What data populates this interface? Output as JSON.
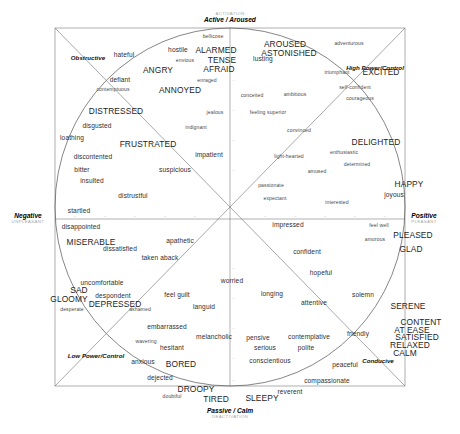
{
  "figure": {
    "type": "scatter",
    "frame": {
      "x": 55,
      "y": 28,
      "w": 350,
      "h": 358
    }
  },
  "axes": {
    "top": {
      "label": "Active / Aroused",
      "sub": "ACTIVATION",
      "x": 230,
      "y": 18
    },
    "bottom": {
      "label": "Passive / Calm",
      "sub": "DEACTIVATION",
      "x": 230,
      "y": 417
    },
    "left": {
      "label": "Negative",
      "sub": "UNPLEASANT",
      "x": 28,
      "y": 219
    },
    "right": {
      "label": "Positive",
      "sub": "PLEASANT",
      "x": 424,
      "y": 219
    }
  },
  "diagonals": [
    {
      "name": "obstructive",
      "label": "Obstructive",
      "x": 88,
      "y": 57
    },
    {
      "name": "high-power",
      "label": "High Power/Control",
      "x": 375,
      "y": 67
    },
    {
      "name": "low-power",
      "label": "Low Power/Control",
      "x": 96,
      "y": 355
    },
    {
      "name": "conducive",
      "label": "Conducive",
      "x": 378,
      "y": 360
    }
  ],
  "ticks": {
    "horizontal": [
      75,
      105,
      135,
      165,
      195,
      265,
      295,
      325,
      355,
      385
    ],
    "vertical": [
      50,
      80,
      110,
      140,
      170,
      268,
      298,
      328,
      358,
      380
    ],
    "axis_y": 219,
    "axis_x": 230
  },
  "chart_data": {
    "type": "scatter",
    "xlabel": "Valence (Unpleasant – Pleasant)",
    "ylabel": "Arousal (Deactivation – Activation)",
    "xlim": [
      -1,
      1
    ],
    "ylim": [
      -1,
      1
    ],
    "grid": false,
    "legend": "none",
    "terms": [
      {
        "label": "bellicose",
        "x": 213,
        "y": 37,
        "size": "sm"
      },
      {
        "label": "hostile",
        "x": 178,
        "y": 50,
        "size": "md"
      },
      {
        "label": "ALARMED",
        "x": 216,
        "y": 50,
        "size": "lg"
      },
      {
        "label": "AROUSED",
        "x": 285,
        "y": 44,
        "size": "lg"
      },
      {
        "label": "adventurous",
        "x": 349,
        "y": 44,
        "size": "sm"
      },
      {
        "label": "hateful",
        "x": 124,
        "y": 55,
        "size": "md"
      },
      {
        "label": "ASTONISHED",
        "x": 289,
        "y": 53,
        "size": "lg"
      },
      {
        "label": "TENSE",
        "x": 222,
        "y": 60,
        "size": "lg"
      },
      {
        "label": "envious",
        "x": 185,
        "y": 61,
        "size": "sm"
      },
      {
        "label": "EXCITED",
        "x": 381,
        "y": 72,
        "size": "lg"
      },
      {
        "label": "lusting",
        "x": 263,
        "y": 59,
        "size": "md"
      },
      {
        "label": "ANGRY",
        "x": 158,
        "y": 70,
        "size": "lg"
      },
      {
        "label": "AFRAID",
        "x": 219,
        "y": 69,
        "size": "lg"
      },
      {
        "label": "triumphant",
        "x": 337,
        "y": 73,
        "size": "sm"
      },
      {
        "label": "defiant",
        "x": 120,
        "y": 80,
        "size": "md"
      },
      {
        "label": "enraged",
        "x": 207,
        "y": 81,
        "size": "sm"
      },
      {
        "label": "self-confident",
        "x": 355,
        "y": 88,
        "size": "sm"
      },
      {
        "label": "contemptuous",
        "x": 113,
        "y": 90,
        "size": "sm"
      },
      {
        "label": "ANNOYED",
        "x": 180,
        "y": 90,
        "size": "lg"
      },
      {
        "label": "conceited",
        "x": 252,
        "y": 96,
        "size": "sm"
      },
      {
        "label": "ambitious",
        "x": 295,
        "y": 95,
        "size": "sm"
      },
      {
        "label": "courageous",
        "x": 360,
        "y": 99,
        "size": "sm"
      },
      {
        "label": "DISTRESSED",
        "x": 116,
        "y": 111,
        "size": "lg"
      },
      {
        "label": "jealous",
        "x": 215,
        "y": 113,
        "size": "sm"
      },
      {
        "label": "feeling superior",
        "x": 268,
        "y": 113,
        "size": "sm"
      },
      {
        "label": "disgusted",
        "x": 97,
        "y": 126,
        "size": "md"
      },
      {
        "label": "indignant",
        "x": 196,
        "y": 128,
        "size": "sm"
      },
      {
        "label": "convinced",
        "x": 299,
        "y": 131,
        "size": "sm"
      },
      {
        "label": "DELIGHTED",
        "x": 376,
        "y": 142,
        "size": "lg"
      },
      {
        "label": "loathing",
        "x": 72,
        "y": 138,
        "size": "md"
      },
      {
        "label": "FRUSTRATED",
        "x": 148,
        "y": 144,
        "size": "lg"
      },
      {
        "label": "light-hearted",
        "x": 289,
        "y": 157,
        "size": "sm"
      },
      {
        "label": "enthusiastic",
        "x": 344,
        "y": 153,
        "size": "sm"
      },
      {
        "label": "discontented",
        "x": 93,
        "y": 157,
        "size": "md"
      },
      {
        "label": "impatient",
        "x": 209,
        "y": 155,
        "size": "md"
      },
      {
        "label": "determined",
        "x": 357,
        "y": 165,
        "size": "sm"
      },
      {
        "label": "bitter",
        "x": 82,
        "y": 170,
        "size": "md"
      },
      {
        "label": "suspicious",
        "x": 175,
        "y": 170,
        "size": "md"
      },
      {
        "label": "amused",
        "x": 317,
        "y": 172,
        "size": "sm"
      },
      {
        "label": "insulted",
        "x": 92,
        "y": 181,
        "size": "md"
      },
      {
        "label": "HAPPY",
        "x": 409,
        "y": 184,
        "size": "lg"
      },
      {
        "label": "passionate",
        "x": 271,
        "y": 186,
        "size": "sm"
      },
      {
        "label": "joyous",
        "x": 394,
        "y": 195,
        "size": "md"
      },
      {
        "label": "distrustful",
        "x": 133,
        "y": 196,
        "size": "md"
      },
      {
        "label": "expectant",
        "x": 275,
        "y": 199,
        "size": "sm"
      },
      {
        "label": "interested",
        "x": 337,
        "y": 203,
        "size": "sm"
      },
      {
        "label": "startled",
        "x": 79,
        "y": 211,
        "size": "md"
      },
      {
        "label": "disappointed",
        "x": 81,
        "y": 227,
        "size": "md"
      },
      {
        "label": "impressed",
        "x": 288,
        "y": 225,
        "size": "md"
      },
      {
        "label": "feel well",
        "x": 379,
        "y": 226,
        "size": "sm"
      },
      {
        "label": "MISERABLE",
        "x": 91,
        "y": 242,
        "size": "lg"
      },
      {
        "label": "apathetic",
        "x": 180,
        "y": 241,
        "size": "md"
      },
      {
        "label": "PLEASED",
        "x": 413,
        "y": 235,
        "size": "lg"
      },
      {
        "label": "dissatisfied",
        "x": 120,
        "y": 249,
        "size": "md"
      },
      {
        "label": "amorous",
        "x": 375,
        "y": 240,
        "size": "sm"
      },
      {
        "label": "GLAD",
        "x": 411,
        "y": 249,
        "size": "lg"
      },
      {
        "label": "taken aback",
        "x": 160,
        "y": 258,
        "size": "md"
      },
      {
        "label": "confident",
        "x": 307,
        "y": 252,
        "size": "md"
      },
      {
        "label": "worried",
        "x": 232,
        "y": 281,
        "size": "md"
      },
      {
        "label": "uncomfortable",
        "x": 102,
        "y": 283,
        "size": "md"
      },
      {
        "label": "hopeful",
        "x": 321,
        "y": 273,
        "size": "md"
      },
      {
        "label": "SAD",
        "x": 79,
        "y": 290,
        "size": "lg"
      },
      {
        "label": "feel guilt",
        "x": 177,
        "y": 295,
        "size": "md"
      },
      {
        "label": "longing",
        "x": 272,
        "y": 294,
        "size": "md"
      },
      {
        "label": "despondent",
        "x": 113,
        "y": 296,
        "size": "md"
      },
      {
        "label": "attentive",
        "x": 314,
        "y": 303,
        "size": "md"
      },
      {
        "label": "solemn",
        "x": 363,
        "y": 295,
        "size": "md"
      },
      {
        "label": "SERENE",
        "x": 408,
        "y": 306,
        "size": "lg"
      },
      {
        "label": "GLOOMY",
        "x": 69,
        "y": 299,
        "size": "lg"
      },
      {
        "label": "DEPRESSED",
        "x": 115,
        "y": 304,
        "size": "lg"
      },
      {
        "label": "languid",
        "x": 204,
        "y": 307,
        "size": "md"
      },
      {
        "label": "desperate",
        "x": 72,
        "y": 310,
        "size": "sm"
      },
      {
        "label": "ashamed",
        "x": 140,
        "y": 310,
        "size": "sm"
      },
      {
        "label": "CONTENT",
        "x": 421,
        "y": 322,
        "size": "lg"
      },
      {
        "label": "embarrassed",
        "x": 167,
        "y": 327,
        "size": "md"
      },
      {
        "label": "AT EASE",
        "x": 412,
        "y": 330,
        "size": "lg"
      },
      {
        "label": "pensive",
        "x": 258,
        "y": 338,
        "size": "md"
      },
      {
        "label": "contemplative",
        "x": 309,
        "y": 337,
        "size": "md"
      },
      {
        "label": "friendly",
        "x": 358,
        "y": 334,
        "size": "md"
      },
      {
        "label": "SATISFIED",
        "x": 417,
        "y": 337,
        "size": "lg"
      },
      {
        "label": "melancholic",
        "x": 214,
        "y": 337,
        "size": "md"
      },
      {
        "label": "RELAXED",
        "x": 410,
        "y": 345,
        "size": "lg"
      },
      {
        "label": "hesitant",
        "x": 172,
        "y": 348,
        "size": "md"
      },
      {
        "label": "serious",
        "x": 265,
        "y": 348,
        "size": "md"
      },
      {
        "label": "polite",
        "x": 306,
        "y": 348,
        "size": "md"
      },
      {
        "label": "CALM",
        "x": 405,
        "y": 353,
        "size": "lg"
      },
      {
        "label": "wavering",
        "x": 146,
        "y": 342,
        "size": "sm"
      },
      {
        "label": "BORED",
        "x": 181,
        "y": 364,
        "size": "lg"
      },
      {
        "label": "anxious",
        "x": 143,
        "y": 362,
        "size": "md"
      },
      {
        "label": "conscientious",
        "x": 270,
        "y": 361,
        "size": "md"
      },
      {
        "label": "peaceful",
        "x": 345,
        "y": 365,
        "size": "md"
      },
      {
        "label": "dejected",
        "x": 160,
        "y": 378,
        "size": "md"
      },
      {
        "label": "DROOPY",
        "x": 196,
        "y": 389,
        "size": "lg"
      },
      {
        "label": "compassionate",
        "x": 327,
        "y": 381,
        "size": "md"
      },
      {
        "label": "doubtful",
        "x": 172,
        "y": 397,
        "size": "sm"
      },
      {
        "label": "TIRED",
        "x": 216,
        "y": 399,
        "size": "lg"
      },
      {
        "label": "SLEEPY",
        "x": 262,
        "y": 398,
        "size": "lg"
      },
      {
        "label": "reverent",
        "x": 290,
        "y": 392,
        "size": "md"
      }
    ]
  }
}
